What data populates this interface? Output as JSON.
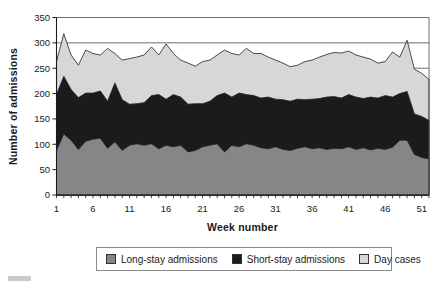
{
  "chart_data": {
    "type": "area",
    "stacked": true,
    "title": "",
    "x_label": "Week number",
    "y_label": "Number of admissions",
    "ylim": [
      0,
      350
    ],
    "yticks": [
      0,
      50,
      100,
      150,
      200,
      250,
      300,
      350
    ],
    "xticks": [
      1,
      6,
      11,
      16,
      21,
      26,
      31,
      36,
      41,
      46,
      51
    ],
    "grid": "horizontal",
    "legend_position": "bottom",
    "x": [
      1,
      2,
      3,
      4,
      5,
      6,
      7,
      8,
      9,
      10,
      11,
      12,
      13,
      14,
      15,
      16,
      17,
      18,
      19,
      20,
      21,
      22,
      23,
      24,
      25,
      26,
      27,
      28,
      29,
      30,
      31,
      32,
      33,
      34,
      35,
      36,
      37,
      38,
      39,
      40,
      41,
      42,
      43,
      44,
      45,
      46,
      47,
      48,
      49,
      50,
      51,
      52
    ],
    "series": [
      {
        "name": "Long-stay admissions",
        "color": "#868686",
        "values": [
          88,
          120,
          108,
          90,
          106,
          110,
          112,
          92,
          105,
          88,
          98,
          101,
          98,
          101,
          91,
          98,
          95,
          98,
          85,
          88,
          95,
          98,
          101,
          85,
          98,
          95,
          101,
          98,
          93,
          91,
          95,
          90,
          88,
          92,
          95,
          91,
          93,
          90,
          92,
          91,
          95,
          90,
          93,
          89,
          92,
          90,
          94,
          108,
          108,
          80,
          74,
          71
        ]
      },
      {
        "name": "Short-stay admissions",
        "color": "#1b1b1b",
        "values": [
          110,
          114,
          100,
          102,
          95,
          91,
          93,
          93,
          116,
          100,
          81,
          79,
          84,
          95,
          107,
          91,
          103,
          95,
          94,
          92,
          85,
          87,
          95,
          116,
          95,
          106,
          97,
          98,
          98,
          102,
          94,
          98,
          97,
          97,
          93,
          98,
          97,
          103,
          102,
          100,
          103,
          103,
          97,
          104,
          99,
          106,
          99,
          92,
          96,
          80,
          81,
          76
        ]
      },
      {
        "name": "Day cases",
        "color": "#d7d7d7",
        "values": [
          65,
          84,
          68,
          64,
          85,
          78,
          71,
          104,
          58,
          78,
          90,
          92,
          94,
          96,
          78,
          109,
          81,
          73,
          81,
          74,
          83,
          81,
          80,
          85,
          86,
          75,
          91,
          83,
          88,
          79,
          77,
          72,
          68,
          67,
          75,
          77,
          82,
          84,
          87,
          89,
          86,
          83,
          82,
          75,
          69,
          67,
          89,
          72,
          101,
          88,
          85,
          81
        ]
      }
    ]
  }
}
